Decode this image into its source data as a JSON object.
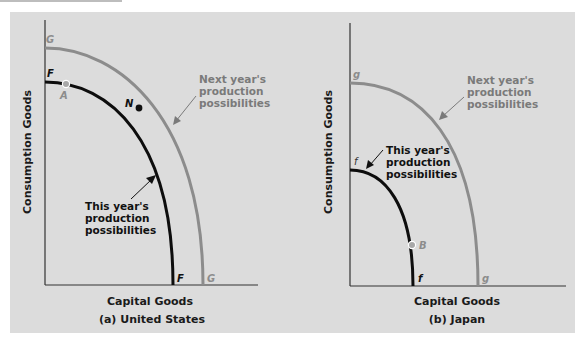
{
  "colors": {
    "background": "#dcdcdc",
    "this_year_curve": "#0d0d0d",
    "next_year_curve": "#8c8c8c",
    "next_year_text": "#7a7a7a",
    "point_fill_light": "#a8a8a8",
    "point_fill_dark": "#111111",
    "axis": "#333333"
  },
  "panels": [
    {
      "id": "a",
      "caption": "(a) United States",
      "x_axis_label": "Capital Goods",
      "y_axis_label": "Consumption Goods",
      "curves": [
        {
          "name": "this_year",
          "start_label": "F",
          "end_label": "F",
          "intercept_y": 0.77,
          "intercept_x": 0.6
        },
        {
          "name": "next_year",
          "start_label": "G",
          "end_label": "G",
          "intercept_y": 0.89,
          "intercept_x": 0.74
        }
      ],
      "points": [
        {
          "label": "A",
          "x": 0.1,
          "y": 0.76,
          "style": "light"
        },
        {
          "label": "N",
          "x": 0.44,
          "y": 0.67,
          "style": "dark"
        }
      ],
      "annotations": {
        "next_year": [
          "Next year's",
          "production",
          "possibilities"
        ],
        "this_year": [
          "This year's",
          "production",
          "possibilities"
        ]
      }
    },
    {
      "id": "b",
      "caption": "(b) Japan",
      "x_axis_label": "Capital Goods",
      "y_axis_label": "Consumption Goods",
      "curves": [
        {
          "name": "this_year",
          "start_label": "f",
          "end_label": "f",
          "intercept_y": 0.44,
          "intercept_x": 0.3
        },
        {
          "name": "next_year",
          "start_label": "g",
          "end_label": "g",
          "intercept_y": 0.77,
          "intercept_x": 0.6
        }
      ],
      "points": [
        {
          "label": "B",
          "x": 0.29,
          "y": 0.16,
          "style": "light"
        }
      ],
      "annotations": {
        "next_year": [
          "Next year's",
          "production",
          "possibilities"
        ],
        "this_year": [
          "This year's",
          "production",
          "possibilities"
        ]
      }
    }
  ]
}
